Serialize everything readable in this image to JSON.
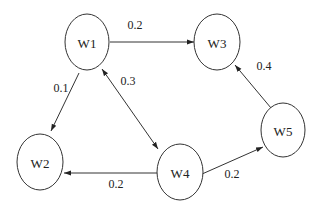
{
  "diagram": {
    "type": "directed-weighted-graph",
    "nodes": [
      {
        "id": "W1",
        "label": "W1"
      },
      {
        "id": "W2",
        "label": "W2"
      },
      {
        "id": "W3",
        "label": "W3"
      },
      {
        "id": "W4",
        "label": "W4"
      },
      {
        "id": "W5",
        "label": "W5"
      }
    ],
    "edges": [
      {
        "from": "W1",
        "to": "W3",
        "weight": "0.2"
      },
      {
        "from": "W1",
        "to": "W2",
        "weight": "0.1"
      },
      {
        "from": "W1",
        "to": "W4",
        "weight": "0.3",
        "bidirectional": true
      },
      {
        "from": "W4",
        "to": "W2",
        "weight": "0.2"
      },
      {
        "from": "W4",
        "to": "W5",
        "weight": "0.2"
      },
      {
        "from": "W5",
        "to": "W3",
        "weight": "0.4"
      }
    ]
  }
}
